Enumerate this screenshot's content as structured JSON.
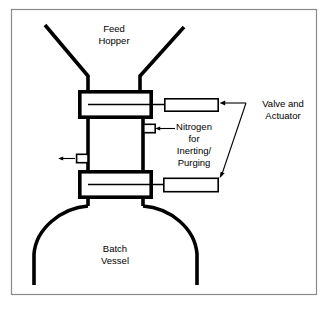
{
  "figure": {
    "width": 328,
    "height": 309,
    "background": "#ffffff",
    "frame_color": "#8a8a8a",
    "line_color": "#000000"
  },
  "labels": {
    "feed_hopper": {
      "line1": "Feed",
      "line2": "Hopper"
    },
    "batch_vessel": {
      "line1": "Batch",
      "line2": "Vessel"
    },
    "nitrogen": {
      "line1": "Nitrogen",
      "line2": "for",
      "line3": "Inerting/",
      "line4": "Purging"
    },
    "valve_and_actuator": {
      "line1": "Valve and",
      "line2": "Actuator"
    }
  },
  "components": {
    "upper_valve": "upper-valve-body",
    "lower_valve": "lower-valve-body",
    "upper_actuator": "upper-actuator",
    "lower_actuator": "lower-actuator",
    "nitrogen_port": "nitrogen-inlet-port",
    "vent_port": "vent-outlet-port",
    "hopper": "feed-hopper-walls",
    "vessel": "batch-vessel-shell",
    "interstitial_column": "interstitial-column"
  }
}
